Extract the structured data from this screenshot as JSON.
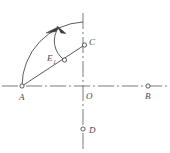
{
  "figure": {
    "background_color": "#ffffff",
    "line_color": "#4a4a4a",
    "centerline_color": "#6b6b6b",
    "width": 170,
    "height": 153
  },
  "axes": {
    "horizontal": {
      "name": "horizontal-centerline",
      "style": "dash-dot",
      "x1": 2,
      "y1": 86,
      "x2": 168,
      "y2": 86
    },
    "vertical": {
      "name": "vertical-centerline",
      "style": "dash-dot",
      "x1": 83,
      "y1": 13,
      "x2": 83,
      "y2": 149
    }
  },
  "points": [
    {
      "id": "A",
      "label": "A",
      "subscript": "",
      "x": 22,
      "y": 86,
      "label_x": 19,
      "label_y": 99,
      "marker": "open-circle"
    },
    {
      "id": "O",
      "label": "O",
      "subscript": "",
      "x": 83,
      "y": 86,
      "label_x": 86,
      "label_y": 99,
      "marker": "none"
    },
    {
      "id": "B",
      "label": "B",
      "subscript": "",
      "x": 148,
      "y": 86,
      "label_x": 145,
      "label_y": 99,
      "marker": "open-circle"
    },
    {
      "id": "C",
      "label": "C",
      "subscript": "",
      "x": 84,
      "y": 45,
      "label_x": 90,
      "label_y": 44,
      "marker": "open-circle"
    },
    {
      "id": "D",
      "label": "D",
      "subscript": "",
      "x": 83,
      "y": 129,
      "label_x": 89,
      "label_y": 133,
      "marker": "open-circle"
    },
    {
      "id": "E1",
      "label": "E",
      "subscript": "1",
      "x": 64,
      "y": 60,
      "label_x": 47,
      "label_y": 58,
      "marker": "open-circle"
    }
  ],
  "segments": [
    {
      "name": "line-A-to-C",
      "from": "A",
      "to": "C",
      "x1": 22,
      "y1": 86,
      "x2": 84,
      "y2": 45
    }
  ],
  "arcs": [
    {
      "name": "outer-trajectory-arc",
      "from": "A",
      "to": "top-of-vertical-axis",
      "start_x": 22,
      "start_y": 86,
      "end_x": 83,
      "end_y": 22,
      "radius": 64,
      "direction": "counterclockwise",
      "arrow": "mid-arrow-pointing-left"
    },
    {
      "name": "inner-trajectory-arc",
      "from": "E1",
      "to": "upper-left",
      "start_x": 64,
      "start_y": 60,
      "end_x": 60,
      "end_y": 27,
      "radius": 24,
      "direction": "counterclockwise",
      "arrow": "end-arrow-pointing-left"
    }
  ],
  "arrows": [
    {
      "name": "outer-arc-arrowhead",
      "x": 53,
      "y": 28,
      "angle_deg": -158
    },
    {
      "name": "inner-arc-arrowhead",
      "x": 62,
      "y": 28,
      "angle_deg": -128
    }
  ]
}
